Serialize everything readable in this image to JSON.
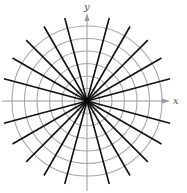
{
  "figure": {
    "center": [
      87,
      101
    ],
    "circles": {
      "count": 6,
      "step": 12.5,
      "color": "#a8a8a8"
    },
    "rays": {
      "angles_deg": [
        15,
        30,
        45,
        60,
        75,
        105,
        120,
        135,
        150,
        165
      ],
      "length": 86,
      "color": "#111111"
    },
    "axes": {
      "color": "#9a9a9a",
      "x_label": "x",
      "y_label": "y"
    }
  }
}
